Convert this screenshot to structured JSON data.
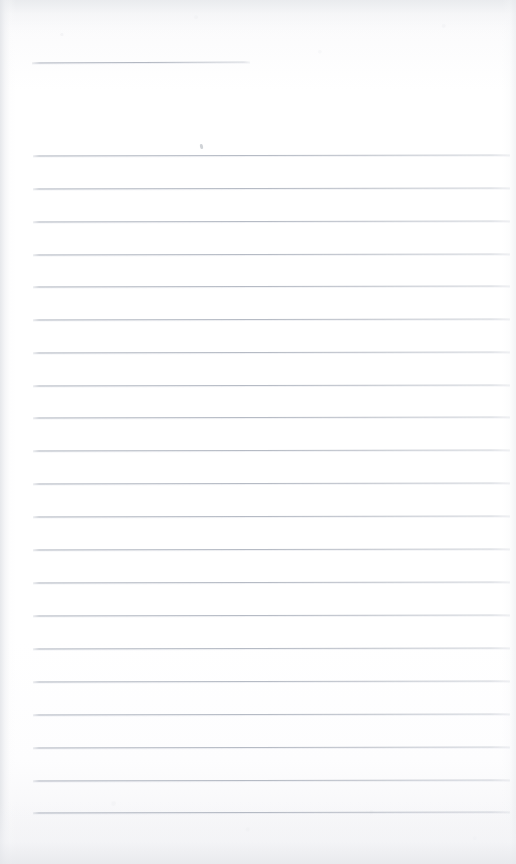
{
  "document": {
    "kind": "scanned-lined-paper",
    "title": "",
    "written_text": "",
    "caption": "Blank scanned ruled notebook page — no handwriting or printed text present",
    "page_width": 516,
    "page_height": 864
  },
  "colors": {
    "paper": "#ffffff",
    "paper_tint": "#f4f5f7",
    "rule_line": "#acb2bd",
    "edge_shadow": "#e2e4e8",
    "speck": "#aaaeb6"
  },
  "layout": {
    "rule_left_x": 33,
    "rule_right_x": 510,
    "first_rule_y": 155,
    "rule_spacing": 32.85,
    "rule_count": 21,
    "top_rule": {
      "y": 62,
      "left_x": 32,
      "right_x": 250,
      "label": "short-header-rule"
    },
    "speck": {
      "x": 200,
      "y": 144
    }
  },
  "rules": [
    {
      "index": 1,
      "y": 155,
      "left": 33,
      "right": 510
    },
    {
      "index": 2,
      "y": 188,
      "left": 33,
      "right": 510
    },
    {
      "index": 3,
      "y": 221,
      "left": 33,
      "right": 510
    },
    {
      "index": 4,
      "y": 254,
      "left": 33,
      "right": 510
    },
    {
      "index": 5,
      "y": 286,
      "left": 33,
      "right": 510
    },
    {
      "index": 6,
      "y": 319,
      "left": 33,
      "right": 510
    },
    {
      "index": 7,
      "y": 352,
      "left": 33,
      "right": 510
    },
    {
      "index": 8,
      "y": 385,
      "left": 33,
      "right": 510
    },
    {
      "index": 9,
      "y": 417,
      "left": 33,
      "right": 510
    },
    {
      "index": 10,
      "y": 450,
      "left": 33,
      "right": 510
    },
    {
      "index": 11,
      "y": 483,
      "left": 33,
      "right": 510
    },
    {
      "index": 12,
      "y": 516,
      "left": 33,
      "right": 510
    },
    {
      "index": 13,
      "y": 549,
      "left": 33,
      "right": 510
    },
    {
      "index": 14,
      "y": 582,
      "left": 33,
      "right": 510
    },
    {
      "index": 15,
      "y": 615,
      "left": 33,
      "right": 510
    },
    {
      "index": 16,
      "y": 648,
      "left": 33,
      "right": 510
    },
    {
      "index": 17,
      "y": 681,
      "left": 33,
      "right": 510
    },
    {
      "index": 18,
      "y": 714,
      "left": 33,
      "right": 510
    },
    {
      "index": 19,
      "y": 747,
      "left": 33,
      "right": 510
    },
    {
      "index": 20,
      "y": 780,
      "left": 33,
      "right": 510
    },
    {
      "index": 21,
      "y": 812,
      "left": 33,
      "right": 510
    }
  ]
}
